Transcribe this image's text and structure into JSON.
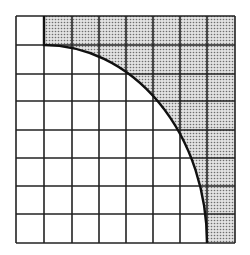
{
  "diagram": {
    "grid": {
      "columns": 8,
      "rows": 8,
      "x_lines": [
        16,
        44,
        72,
        99,
        126,
        153,
        180,
        207,
        235
      ],
      "y_lines": [
        16,
        45,
        74,
        101,
        130,
        158,
        186,
        214,
        243
      ]
    },
    "arc": {
      "center": [
        44,
        243
      ],
      "rx": 163,
      "ry": 198,
      "start": [
        44,
        45
      ],
      "end": [
        207,
        243
      ]
    },
    "colors": {
      "line": "#222222",
      "shade": "#bdbdbd",
      "background": "#ffffff"
    }
  }
}
